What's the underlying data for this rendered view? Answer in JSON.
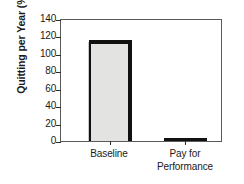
{
  "chart_data": {
    "type": "bar",
    "title": "",
    "subtitle": "",
    "xlabel": "",
    "ylabel": "Quitting per Year (%)",
    "categories": [
      "Baseline",
      "Pay for Performance"
    ],
    "category_lines": [
      [
        "Baseline"
      ],
      [
        "Pay for",
        "Performance"
      ]
    ],
    "values": [
      117,
      3
    ],
    "series": [
      {
        "name": "Quitting per Year",
        "values": [
          117,
          3
        ]
      }
    ],
    "ylim": [
      0,
      140
    ],
    "ytick_values": [
      0,
      20,
      40,
      60,
      80,
      100,
      120,
      140
    ],
    "ytick_labels": [
      "0",
      "20",
      "40",
      "60",
      "80",
      "100",
      "120",
      "140"
    ],
    "grid": false,
    "legend": null,
    "legend_position": "none",
    "annotations": [],
    "style": {
      "bar_fill": "#e3e3e1",
      "bar_outline": "#111111",
      "frame_color": "#5a5a5a",
      "text_color": "#1a1a1a",
      "background": "#ffffff"
    }
  }
}
